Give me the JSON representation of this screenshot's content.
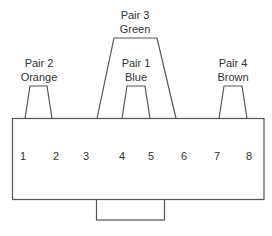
{
  "diagram": {
    "type": "rj45-pinout",
    "pairs": [
      {
        "id": "pair2",
        "line1": "Pair 2",
        "line2": "Orange",
        "pins": [
          1,
          2
        ]
      },
      {
        "id": "pair3",
        "line1": "Pair 3",
        "line2": "Green",
        "pins": [
          3,
          6
        ]
      },
      {
        "id": "pair1",
        "line1": "Pair 1",
        "line2": "Blue",
        "pins": [
          4,
          5
        ]
      },
      {
        "id": "pair4",
        "line1": "Pair 4",
        "line2": "Brown",
        "pins": [
          7,
          8
        ]
      }
    ],
    "pins": [
      "1",
      "2",
      "3",
      "4",
      "5",
      "6",
      "7",
      "8"
    ],
    "colors": {
      "line": "#555555",
      "text": "#333333",
      "background": "#ffffff"
    }
  }
}
